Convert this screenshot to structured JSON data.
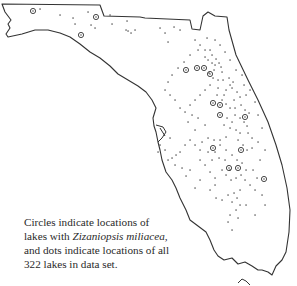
{
  "map": {
    "region": "Florida",
    "outline_color": "#333333",
    "marker_color": "#333333",
    "legend": {
      "circle": "lakes with Zizaniopsis miliacea",
      "dot": "all lakes in data set"
    },
    "total_lakes": 322
  },
  "caption": {
    "line1": "Circles indicate locations of",
    "line2_pre": "lakes with ",
    "line2_species": "Zizaniopsis miliacea,",
    "line3": "and dots indicate locations of all",
    "line4": "322 lakes in data set."
  },
  "circles": [
    [
      33,
      11
    ],
    [
      96,
      17
    ],
    [
      81,
      35
    ],
    [
      197,
      68
    ],
    [
      204,
      68
    ],
    [
      210,
      74
    ],
    [
      213,
      103
    ],
    [
      220,
      105
    ],
    [
      220,
      115
    ],
    [
      245,
      117
    ],
    [
      241,
      150
    ],
    [
      229,
      168
    ],
    [
      238,
      168
    ],
    [
      264,
      179
    ],
    [
      213,
      148
    ],
    [
      186,
      70
    ]
  ],
  "dots": [
    [
      40,
      9
    ],
    [
      60,
      15
    ],
    [
      73,
      18
    ],
    [
      75,
      24
    ],
    [
      88,
      12
    ],
    [
      91,
      25
    ],
    [
      95,
      28
    ],
    [
      110,
      15
    ],
    [
      112,
      24
    ],
    [
      127,
      21
    ],
    [
      128,
      31
    ],
    [
      131,
      33
    ],
    [
      135,
      30
    ],
    [
      126,
      30
    ],
    [
      160,
      28
    ],
    [
      165,
      33
    ],
    [
      168,
      42
    ],
    [
      174,
      27
    ],
    [
      180,
      30
    ],
    [
      195,
      40
    ],
    [
      200,
      45
    ],
    [
      205,
      50
    ],
    [
      210,
      50
    ],
    [
      212,
      55
    ],
    [
      205,
      57
    ],
    [
      208,
      60
    ],
    [
      216,
      59
    ],
    [
      219,
      63
    ],
    [
      212,
      63
    ],
    [
      215,
      65
    ],
    [
      221,
      67
    ],
    [
      222,
      72
    ],
    [
      214,
      70
    ],
    [
      209,
      73
    ],
    [
      213,
      78
    ],
    [
      218,
      80
    ],
    [
      223,
      80
    ],
    [
      229,
      78
    ],
    [
      233,
      82
    ],
    [
      230,
      85
    ],
    [
      226,
      90
    ],
    [
      232,
      88
    ],
    [
      237,
      92
    ],
    [
      240,
      97
    ],
    [
      246,
      95
    ],
    [
      234,
      100
    ],
    [
      224,
      95
    ],
    [
      217,
      95
    ],
    [
      222,
      100
    ],
    [
      226,
      104
    ],
    [
      230,
      108
    ],
    [
      235,
      108
    ],
    [
      241,
      105
    ],
    [
      245,
      110
    ],
    [
      249,
      113
    ],
    [
      235,
      115
    ],
    [
      240,
      118
    ],
    [
      244,
      122
    ],
    [
      247,
      126
    ],
    [
      224,
      125
    ],
    [
      230,
      128
    ],
    [
      236,
      130
    ],
    [
      240,
      133
    ],
    [
      248,
      133
    ],
    [
      252,
      138
    ],
    [
      226,
      137
    ],
    [
      220,
      140
    ],
    [
      214,
      140
    ],
    [
      208,
      138
    ],
    [
      202,
      142
    ],
    [
      215,
      152
    ],
    [
      219,
      158
    ],
    [
      225,
      160
    ],
    [
      232,
      155
    ],
    [
      237,
      160
    ],
    [
      242,
      163
    ],
    [
      246,
      170
    ],
    [
      241,
      175
    ],
    [
      236,
      178
    ],
    [
      231,
      180
    ],
    [
      226,
      175
    ],
    [
      222,
      170
    ],
    [
      234,
      193
    ],
    [
      237,
      198
    ],
    [
      240,
      205
    ],
    [
      236,
      210
    ],
    [
      205,
      125
    ],
    [
      198,
      118
    ],
    [
      192,
      115
    ],
    [
      188,
      122
    ],
    [
      195,
      130
    ],
    [
      190,
      140
    ],
    [
      185,
      145
    ],
    [
      180,
      152
    ],
    [
      176,
      155
    ],
    [
      172,
      158
    ],
    [
      168,
      160
    ],
    [
      175,
      165
    ],
    [
      182,
      168
    ],
    [
      186,
      176
    ],
    [
      190,
      170
    ],
    [
      200,
      160
    ],
    [
      205,
      165
    ],
    [
      210,
      172
    ],
    [
      215,
      178
    ],
    [
      200,
      180
    ],
    [
      195,
      188
    ],
    [
      210,
      190
    ],
    [
      215,
      185
    ],
    [
      216,
      198
    ],
    [
      222,
      200
    ],
    [
      228,
      195
    ],
    [
      232,
      202
    ],
    [
      240,
      190
    ],
    [
      253,
      170
    ],
    [
      257,
      178
    ],
    [
      252,
      148
    ],
    [
      258,
      142
    ],
    [
      262,
      128
    ],
    [
      258,
      115
    ],
    [
      255,
      102
    ],
    [
      250,
      90
    ],
    [
      244,
      85
    ],
    [
      242,
      75
    ],
    [
      236,
      70
    ],
    [
      230,
      60
    ],
    [
      225,
      52
    ],
    [
      220,
      45
    ],
    [
      215,
      40
    ],
    [
      207,
      38
    ],
    [
      198,
      50
    ],
    [
      190,
      55
    ],
    [
      184,
      62
    ],
    [
      178,
      68
    ],
    [
      172,
      75
    ],
    [
      168,
      82
    ],
    [
      165,
      90
    ],
    [
      170,
      95
    ],
    [
      175,
      100
    ],
    [
      180,
      108
    ],
    [
      185,
      112
    ],
    [
      190,
      105
    ],
    [
      195,
      100
    ],
    [
      200,
      95
    ],
    [
      205,
      90
    ],
    [
      210,
      85
    ],
    [
      218,
      88
    ],
    [
      227,
      118
    ],
    [
      232,
      122
    ],
    [
      238,
      140
    ],
    [
      243,
      145
    ],
    [
      247,
      150
    ],
    [
      226,
      150
    ],
    [
      220,
      145
    ],
    [
      212,
      160
    ],
    [
      208,
      152
    ],
    [
      200,
      150
    ],
    [
      195,
      145
    ],
    [
      230,
      170
    ],
    [
      245,
      180
    ],
    [
      250,
      185
    ],
    [
      255,
      190
    ],
    [
      260,
      160
    ],
    [
      265,
      150
    ],
    [
      262,
      195
    ],
    [
      265,
      205
    ],
    [
      230,
      215
    ],
    [
      228,
      222
    ],
    [
      232,
      230
    ],
    [
      238,
      218
    ],
    [
      246,
      205
    ],
    [
      255,
      215
    ],
    [
      160,
      145
    ],
    [
      165,
      150
    ],
    [
      170,
      138
    ],
    [
      158,
      152
    ]
  ]
}
